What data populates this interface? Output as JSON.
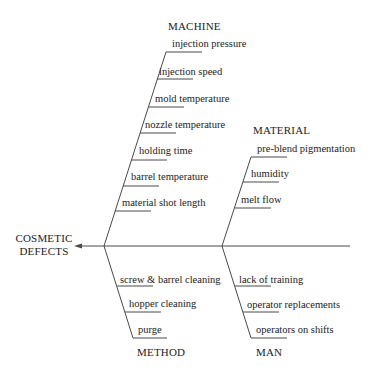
{
  "diagram": {
    "type": "fishbone",
    "effect": {
      "line1": "COSMETIC",
      "line2": "DEFECTS"
    },
    "categories": {
      "machine": {
        "label": "MACHINE",
        "causes": [
          "injection pressure",
          "injection speed",
          "mold temperature",
          "nozzle temperature",
          "holding time",
          "barrel temperature",
          "material shot length"
        ]
      },
      "material": {
        "label": "MATERIAL",
        "causes": [
          "pre-blend pigmentation",
          "humidity",
          "melt flow"
        ]
      },
      "method": {
        "label": "METHOD",
        "causes": [
          "screw & barrel cleaning",
          "hopper cleaning",
          "purge"
        ]
      },
      "man": {
        "label": "MAN",
        "causes": [
          "lack of training",
          "operator replacements",
          "operators on shifts"
        ]
      }
    },
    "colors": {
      "line": "#4a4a4a",
      "text": "#222222",
      "background": "#ffffff"
    }
  }
}
